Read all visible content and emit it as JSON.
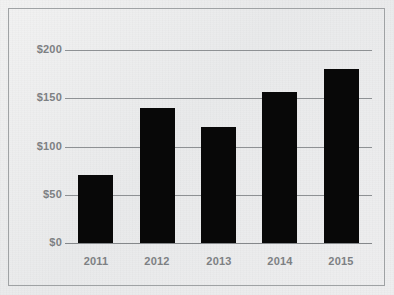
{
  "chart_data": {
    "type": "bar",
    "title": "",
    "subtitle": "",
    "xlabel": "",
    "ylabel": "",
    "categories": [
      "2011",
      "2012",
      "2013",
      "2014",
      "2015"
    ],
    "values": [
      70,
      140,
      120,
      156,
      180
    ],
    "series": [
      {
        "name": "",
        "values": [
          70,
          140,
          120,
          156,
          180
        ]
      }
    ],
    "ylim": [
      0,
      200
    ],
    "yticks": [
      0,
      50,
      100,
      150,
      200
    ],
    "ytick_labels": [
      "$0",
      "$50",
      "$100",
      "$150",
      "$200"
    ],
    "xtick_labels": [
      "2011",
      "2012",
      "2013",
      "2014",
      "2015"
    ],
    "grid": true,
    "grid_axis": "y",
    "legend": false,
    "legend_position": "none",
    "bar_color": "#080808",
    "gridline_color": "#8e9194",
    "tick_label_color": "#7d8083",
    "background_color": "#ecedee",
    "border_color": "#9fa2a4",
    "annotations": []
  },
  "figure": {
    "frame_label": "chart-border",
    "plot_label": "plot-area"
  }
}
